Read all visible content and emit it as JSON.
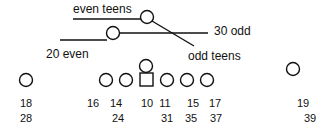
{
  "labels": {
    "even_teens": "even teens",
    "thirty_odd": "30 odd",
    "twenty_even": "20 even",
    "odd_teens": "odd teens"
  },
  "nodes": [
    {
      "id": "n18",
      "shape": "circle",
      "top": "18",
      "bottom": "28"
    },
    {
      "id": "n16",
      "shape": "circle",
      "top": "16",
      "bottom": ""
    },
    {
      "id": "n14",
      "shape": "circle",
      "top": "14",
      "bottom": "24"
    },
    {
      "id": "n10",
      "shape": "square",
      "top": "10",
      "bottom": ""
    },
    {
      "id": "n11",
      "shape": "circle",
      "top": "11",
      "bottom": "31"
    },
    {
      "id": "n15",
      "shape": "circle",
      "top": "15",
      "bottom": "35"
    },
    {
      "id": "n17",
      "shape": "circle",
      "top": "17",
      "bottom": "37"
    },
    {
      "id": "n19",
      "shape": "circle",
      "top": "19",
      "bottom": "39"
    }
  ],
  "colors": {
    "stroke": "#111111",
    "background": "#ffffff"
  }
}
